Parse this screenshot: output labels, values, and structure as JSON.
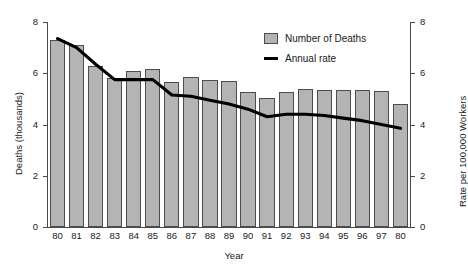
{
  "chart_data": {
    "type": "bar",
    "title": "",
    "xlabel": "Year",
    "ylabel": "Deaths (thousands)",
    "ylabel_secondary": "Rate per 100,000 Workers",
    "ylim": [
      0,
      8
    ],
    "ylim_secondary": [
      0,
      8
    ],
    "yticks": [
      "0",
      "2",
      "4",
      "6",
      "8"
    ],
    "yticks_secondary": [
      "0",
      "2",
      "4",
      "6",
      "8"
    ],
    "grid": false,
    "legend_position": "top-right",
    "categories": [
      "80",
      "81",
      "82",
      "83",
      "84",
      "85",
      "86",
      "87",
      "88",
      "89",
      "90",
      "91",
      "92",
      "93",
      "94",
      "95",
      "96",
      "97",
      "80"
    ],
    "series": [
      {
        "name": "Number of Deaths",
        "type": "bar",
        "axis": "left",
        "color": "#b4b4b4",
        "edge_color": "#4d4d4d",
        "values": [
          7.3,
          7.1,
          6.3,
          5.8,
          6.1,
          6.15,
          5.65,
          5.85,
          5.75,
          5.7,
          5.25,
          5.05,
          5.25,
          5.4,
          5.35,
          5.35,
          5.35,
          5.3,
          4.8
        ]
      },
      {
        "name": "Annual rate",
        "type": "line",
        "axis": "right",
        "color": "#000000",
        "values": [
          7.35,
          7.0,
          6.35,
          5.75,
          5.75,
          5.75,
          5.15,
          5.1,
          4.95,
          4.8,
          4.6,
          4.3,
          4.4,
          4.4,
          4.35,
          4.25,
          4.15,
          4.0,
          3.85
        ]
      }
    ]
  },
  "legend": {
    "bars_label": "Number of Deaths",
    "line_label": "Annual rate"
  }
}
